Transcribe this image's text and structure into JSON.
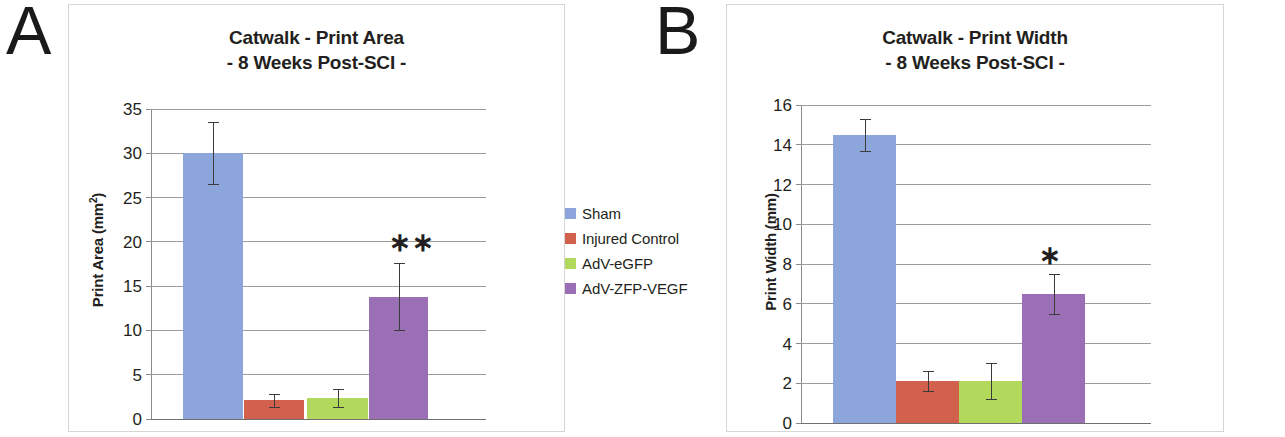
{
  "figure": {
    "panels": [
      {
        "letter": "A",
        "title_line1": "Catwalk - Print Area",
        "title_line2": "- 8 Weeks Post-SCI -",
        "axis_title": "Print Area (mm",
        "axis_title_sup": "2",
        "axis_title_close": ")",
        "significance": "∗∗"
      },
      {
        "letter": "B",
        "title_line1": "Catwalk - Print Width",
        "title_line2": "- 8 Weeks Post-SCI -",
        "axis_title": "Print Width (mm)",
        "axis_title_sup": "",
        "axis_title_close": "",
        "significance": "∗"
      }
    ],
    "legend": {
      "items": [
        {
          "label": "Sham",
          "color": "#8CA6DC"
        },
        {
          "label": "Injured Control",
          "color": "#D1604C"
        },
        {
          "label": "AdV-eGFP",
          "color": "#B3D95C"
        },
        {
          "label": "AdV-ZFP-VEGF",
          "color": "#9A6FB5"
        }
      ]
    }
  },
  "chart_data": [
    {
      "type": "bar",
      "title": "Catwalk - Print Area - 8 Weeks Post-SCI -",
      "xlabel": "",
      "ylabel": "Print Area (mm2)",
      "ylim": [
        0,
        35
      ],
      "ytick_step": 5,
      "yticks": [
        0,
        5,
        10,
        15,
        20,
        25,
        30,
        35
      ],
      "grid": true,
      "legend_position": "right",
      "categories": [
        "Sham",
        "Injured Control",
        "AdV-eGFP",
        "AdV-ZFP-VEGF"
      ],
      "colors": [
        "#8CA6DC",
        "#D1604C",
        "#B3D95C",
        "#9A6FB5"
      ],
      "values": [
        30.0,
        2.1,
        2.4,
        13.8
      ],
      "errors": [
        3.5,
        0.7,
        1.0,
        3.8
      ],
      "annotations": [
        {
          "text": "∗∗",
          "category": "AdV-ZFP-VEGF",
          "y": 21.5
        }
      ]
    },
    {
      "type": "bar",
      "title": "Catwalk - Print Width - 8 Weeks Post-SCI -",
      "xlabel": "",
      "ylabel": "Print Width (mm)",
      "ylim": [
        0,
        16
      ],
      "ytick_step": 2,
      "yticks": [
        0,
        2,
        4,
        6,
        8,
        10,
        12,
        14,
        16
      ],
      "grid": true,
      "legend_position": "right",
      "categories": [
        "Sham",
        "Injured Control",
        "AdV-eGFP",
        "AdV-ZFP-VEGF"
      ],
      "colors": [
        "#8CA6DC",
        "#D1604C",
        "#B3D95C",
        "#9A6FB5"
      ],
      "values": [
        14.5,
        2.1,
        2.1,
        6.5
      ],
      "errors": [
        0.8,
        0.5,
        0.9,
        1.0
      ],
      "annotations": [
        {
          "text": "∗",
          "category": "AdV-ZFP-VEGF",
          "y": 9.1
        }
      ]
    }
  ]
}
